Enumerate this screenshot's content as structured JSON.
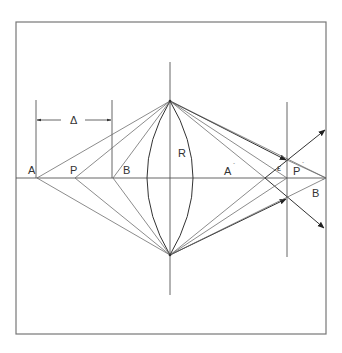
{
  "figure": {
    "type": "lens ray diagram",
    "labels": {
      "A": "A",
      "P": "P",
      "B": "B",
      "R": "R",
      "A_prime": "A",
      "P_prime": "P",
      "B_prime": "B",
      "prime_mark": "´",
      "epsilon": "ε",
      "delta": "Δ"
    },
    "colors": {
      "line": "#555555",
      "frame": "#777777",
      "background": "#ffffff"
    }
  }
}
